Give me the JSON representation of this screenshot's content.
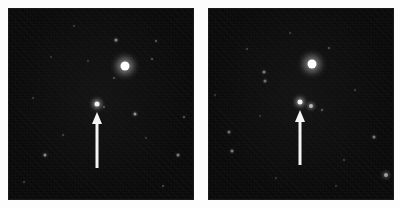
{
  "figure": {
    "background_color": "#fdfdfd",
    "panel_background_color": "#090909",
    "marker_color": "#f4f4f4",
    "star_color": "#ffffff",
    "panel_count": 2,
    "caption": ""
  },
  "panels": [
    {
      "id": "panel-left",
      "name": "left-sky-image",
      "label": "",
      "x": 9,
      "y": 9,
      "width": 184,
      "height": 190,
      "arrow": {
        "name": "target-arrow",
        "x": 97,
        "y_tip": 112,
        "y_tail": 168,
        "head_height": 12,
        "shaft_width": 3,
        "direction": "up",
        "points_to": "target-star"
      },
      "target_star": {
        "x": 97,
        "y": 104,
        "size": 5,
        "brightness": 0.95
      },
      "stars": [
        {
          "x": 125,
          "y": 66,
          "size": 9,
          "brightness": 1.0
        },
        {
          "x": 116,
          "y": 40,
          "size": 3,
          "brightness": 0.5
        },
        {
          "x": 156,
          "y": 41,
          "size": 2,
          "brightness": 0.35
        },
        {
          "x": 152,
          "y": 59,
          "size": 2,
          "brightness": 0.3
        },
        {
          "x": 135,
          "y": 114,
          "size": 3,
          "brightness": 0.55
        },
        {
          "x": 104,
          "y": 107,
          "size": 2,
          "brightness": 0.3
        },
        {
          "x": 114,
          "y": 78,
          "size": 2,
          "brightness": 0.28
        },
        {
          "x": 45,
          "y": 155,
          "size": 3,
          "brightness": 0.5
        },
        {
          "x": 178,
          "y": 155,
          "size": 3,
          "brightness": 0.45
        },
        {
          "x": 184,
          "y": 117,
          "size": 2,
          "brightness": 0.35
        },
        {
          "x": 63,
          "y": 135,
          "size": 2,
          "brightness": 0.25
        },
        {
          "x": 33,
          "y": 98,
          "size": 2,
          "brightness": 0.22
        },
        {
          "x": 74,
          "y": 26,
          "size": 2,
          "brightness": 0.22
        },
        {
          "x": 163,
          "y": 186,
          "size": 2,
          "brightness": 0.28
        },
        {
          "x": 24,
          "y": 182,
          "size": 2,
          "brightness": 0.24
        },
        {
          "x": 88,
          "y": 61,
          "size": 2,
          "brightness": 0.2
        },
        {
          "x": 51,
          "y": 57,
          "size": 2,
          "brightness": 0.18
        },
        {
          "x": 146,
          "y": 138,
          "size": 2,
          "brightness": 0.2
        }
      ]
    },
    {
      "id": "panel-right",
      "name": "right-sky-image",
      "label": "",
      "x": 209,
      "y": 9,
      "width": 184,
      "height": 190,
      "arrow": {
        "name": "target-arrow",
        "x": 300,
        "y_tip": 110,
        "y_tail": 165,
        "head_height": 12,
        "shaft_width": 3,
        "direction": "up",
        "points_to": "target-star"
      },
      "target_star": {
        "x": 300,
        "y": 102,
        "size": 5,
        "brightness": 0.95
      },
      "stars": [
        {
          "x": 312,
          "y": 64,
          "size": 9,
          "brightness": 1.0
        },
        {
          "x": 311,
          "y": 106,
          "size": 4,
          "brightness": 0.7
        },
        {
          "x": 329,
          "y": 48,
          "size": 2,
          "brightness": 0.3
        },
        {
          "x": 264,
          "y": 72,
          "size": 3,
          "brightness": 0.45
        },
        {
          "x": 265,
          "y": 81,
          "size": 3,
          "brightness": 0.4
        },
        {
          "x": 322,
          "y": 110,
          "size": 2,
          "brightness": 0.35
        },
        {
          "x": 374,
          "y": 137,
          "size": 3,
          "brightness": 0.45
        },
        {
          "x": 386,
          "y": 175,
          "size": 4,
          "brightness": 0.6
        },
        {
          "x": 229,
          "y": 132,
          "size": 3,
          "brightness": 0.4
        },
        {
          "x": 232,
          "y": 151,
          "size": 3,
          "brightness": 0.45
        },
        {
          "x": 247,
          "y": 49,
          "size": 2,
          "brightness": 0.25
        },
        {
          "x": 290,
          "y": 33,
          "size": 2,
          "brightness": 0.22
        },
        {
          "x": 355,
          "y": 90,
          "size": 2,
          "brightness": 0.22
        },
        {
          "x": 344,
          "y": 160,
          "size": 2,
          "brightness": 0.24
        },
        {
          "x": 276,
          "y": 178,
          "size": 2,
          "brightness": 0.2
        },
        {
          "x": 215,
          "y": 95,
          "size": 2,
          "brightness": 0.2
        },
        {
          "x": 260,
          "y": 116,
          "size": 2,
          "brightness": 0.18
        },
        {
          "x": 336,
          "y": 186,
          "size": 2,
          "brightness": 0.2
        }
      ]
    }
  ]
}
